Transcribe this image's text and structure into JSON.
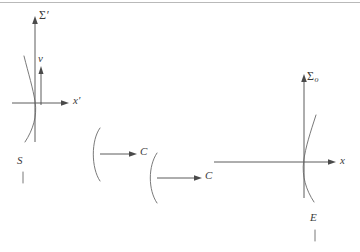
{
  "figure": {
    "type": "physics-diagram",
    "background_color": "#ffffff",
    "ink_color": "#4a4a4a",
    "curve_color": "#6a6a6a",
    "width": 360,
    "height": 252
  },
  "left_frame": {
    "name": "moving-frame",
    "vertical_axis_label": "Σ",
    "vertical_axis_prime": "′",
    "horizontal_axis_label": "x",
    "horizontal_axis_prime": "′",
    "velocity_label": "v",
    "curve_label": "S",
    "origin": {
      "x": 50,
      "y": 103
    }
  },
  "right_frame": {
    "name": "rest-frame",
    "vertical_axis_label": "Σ",
    "vertical_axis_subscript": "o",
    "horizontal_axis_label": "x",
    "curve_label": "E",
    "origin": {
      "x": 304,
      "y": 162
    }
  },
  "middle": {
    "arc_upper_label": "C",
    "arc_lower_label": "C"
  },
  "labels": {
    "sigma_prime": "Σ",
    "sigma_o": "Σ",
    "x_prime": "x",
    "x": "x",
    "v": "v",
    "S": "S",
    "E": "E",
    "C_upper": "C",
    "C_lower": "C",
    "prime_mark": "′",
    "o_subscript": "o"
  }
}
